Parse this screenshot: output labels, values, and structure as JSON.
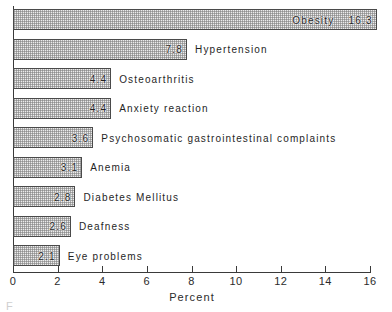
{
  "chart_data": {
    "type": "bar",
    "orientation": "horizontal",
    "title": "",
    "xlabel": "Percent",
    "ylabel": "",
    "xlim": [
      0,
      16
    ],
    "xticks": [
      0,
      2,
      4,
      6,
      8,
      10,
      12,
      14,
      16
    ],
    "xtick_labels": [
      "0",
      "2",
      "4",
      "6",
      "8",
      "10",
      "12",
      "14",
      "16"
    ],
    "grid": false,
    "legend": null,
    "categories": [
      "Obesity",
      "Hypertension",
      "Osteoarthritis",
      "Anxiety reaction",
      "Psychosomatic gastrointestinal complaints",
      "Anemia",
      "Diabetes Mellitus",
      "Deafness",
      "Eye problems"
    ],
    "values": [
      16.3,
      7.8,
      4.4,
      4.4,
      3.6,
      3.1,
      2.8,
      2.6,
      2.1
    ],
    "value_labels": [
      "16.3",
      "7.8",
      "4.4",
      "4.4",
      "3.6",
      "3.1",
      "2.8",
      "2.6",
      "2.1"
    ],
    "bars": [
      {
        "label": "Obesity",
        "value": 16.3,
        "value_label": "16.3",
        "label_inside": true
      },
      {
        "label": "Hypertension",
        "value": 7.8,
        "value_label": "7.8",
        "label_inside": false
      },
      {
        "label": "Osteoarthritis",
        "value": 4.4,
        "value_label": "4.4",
        "label_inside": false
      },
      {
        "label": "Anxiety reaction",
        "value": 4.4,
        "value_label": "4.4",
        "label_inside": false
      },
      {
        "label": "Psychosomatic gastrointestinal complaints",
        "value": 3.6,
        "value_label": "3.6",
        "label_inside": false
      },
      {
        "label": "Anemia",
        "value": 3.1,
        "value_label": "3.1",
        "label_inside": false
      },
      {
        "label": "Diabetes Mellitus",
        "value": 2.8,
        "value_label": "2.8",
        "label_inside": false
      },
      {
        "label": "Deafness",
        "value": 2.6,
        "value_label": "2.6",
        "label_inside": false
      },
      {
        "label": "Eye problems",
        "value": 2.1,
        "value_label": "2.1",
        "label_inside": false
      }
    ],
    "colors": {
      "bar_fill": "#ececec",
      "bar_stipple": "#787878",
      "bar_border": "#4a4a4a",
      "axis": "#3a3a3a",
      "text": "#1f1f1f",
      "background": "#ffffff"
    }
  },
  "caption_sliver": "F"
}
